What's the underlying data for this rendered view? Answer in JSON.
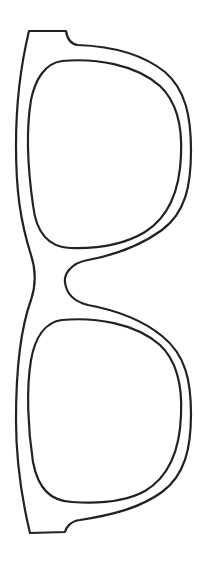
{
  "image": {
    "subject": "sunglasses outline",
    "alt": "Line-art outline of a pair of sunglasses frames, oriented vertically",
    "stroke_color": "#222222",
    "background_color": "#ffffff",
    "parts": [
      {
        "name": "outer-frame"
      },
      {
        "name": "upper-lens"
      },
      {
        "name": "lower-lens"
      }
    ]
  }
}
